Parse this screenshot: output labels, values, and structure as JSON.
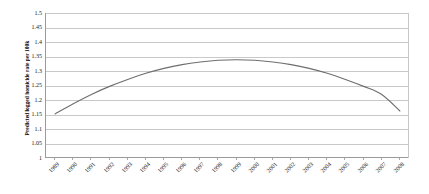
{
  "chart_data": {
    "type": "line",
    "title": "",
    "xlabel": "",
    "ylabel": "Predicted logged homicide rate per 100k",
    "ylim": [
      1,
      1.5
    ],
    "ytick_step": 0.05,
    "yticks": [
      "1",
      "1.05",
      "1.1",
      "1.15",
      "1.2",
      "1.25",
      "1.3",
      "1.35",
      "1.4",
      "1.45",
      "1.5"
    ],
    "grid": true,
    "legend": "none",
    "x": [
      1989,
      1990,
      1991,
      1992,
      1993,
      1994,
      1995,
      1996,
      1997,
      1998,
      1999,
      2000,
      2001,
      2002,
      2003,
      2004,
      2005,
      2006,
      2007,
      2008
    ],
    "xtick_labels": [
      "1989",
      "1990",
      "1991",
      "1992",
      "1993",
      "1994",
      "1995",
      "1996",
      "1997",
      "1998",
      "1999",
      "2000",
      "2001",
      "2002",
      "2003",
      "2004",
      "2005",
      "2006",
      "2007",
      "2008"
    ],
    "series": [
      {
        "name": "Predicted logged homicide rate",
        "color": "#6e6e6e",
        "values": [
          1.152,
          1.187,
          1.219,
          1.247,
          1.271,
          1.292,
          1.309,
          1.322,
          1.331,
          1.337,
          1.339,
          1.337,
          1.331,
          1.322,
          1.309,
          1.292,
          1.271,
          1.247,
          1.219,
          1.162
        ]
      }
    ]
  },
  "style": {
    "curve_color": "#6e6e6e",
    "grid_color": "#c9c9c9",
    "axis_color": "#9a9a9a",
    "text_color": "#1a1a1a",
    "background": "#ffffff"
  }
}
